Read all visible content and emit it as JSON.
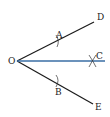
{
  "diagram": {
    "type": "angle-bisector-construction",
    "points": {
      "O": {
        "label": "O",
        "x": 17,
        "y": 61
      },
      "D": {
        "label": "D",
        "x": 94,
        "y": 22
      },
      "C": {
        "label": "C",
        "x": 105,
        "y": 62
      },
      "E": {
        "label": "E",
        "x": 93,
        "y": 104
      },
      "A": {
        "label": "A",
        "x": 58,
        "y": 40
      },
      "B": {
        "label": "B",
        "x": 57,
        "y": 84
      }
    },
    "colors": {
      "rays": "#1a1a1a",
      "bisector": "#3a6ea5"
    }
  }
}
